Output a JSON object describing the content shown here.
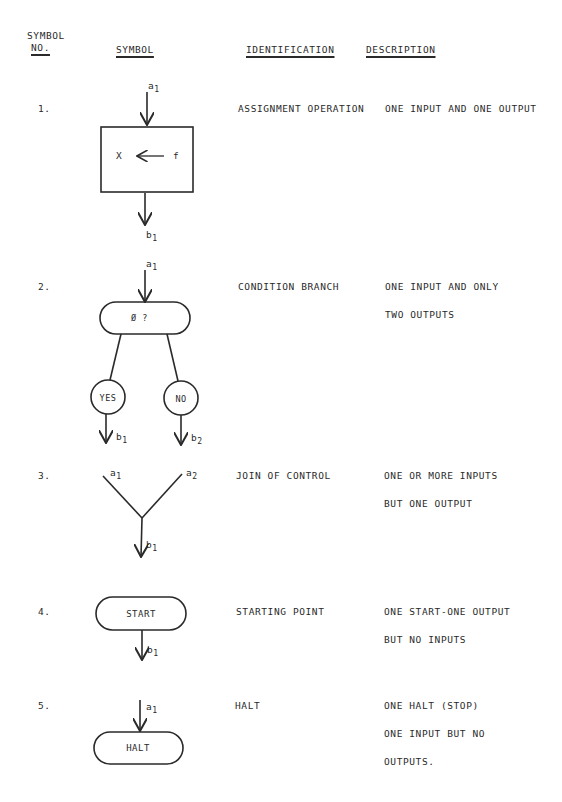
{
  "header": {
    "symbol_no_line1": "SYMBOL",
    "symbol_no_line2": "NO.",
    "symbol": "SYMBOL",
    "identification": "IDENTIFICATION",
    "description": "DESCRIPTION"
  },
  "rows": [
    {
      "number": "1.",
      "identification": "ASSIGNMENT OPERATION",
      "description": [
        "ONE INPUT AND ONE OUTPUT"
      ],
      "symbol": {
        "type": "rectangle",
        "content_left": "X",
        "content_right": "f",
        "arrow": "left-arrow",
        "input_label": "a",
        "input_sub": "1",
        "output_label": "b",
        "output_sub": "1"
      }
    },
    {
      "number": "2.",
      "identification": "CONDITION BRANCH",
      "description": [
        "ONE INPUT AND ONLY",
        "TWO OUTPUTS"
      ],
      "symbol": {
        "type": "pill",
        "content": "Ø ?",
        "input_label": "a",
        "input_sub": "1",
        "yes_label": "YES",
        "no_label": "NO",
        "output1_label": "b",
        "output1_sub": "1",
        "output2_label": "b",
        "output2_sub": "2"
      }
    },
    {
      "number": "3.",
      "identification": "JOIN OF CONTROL",
      "description": [
        "ONE OR MORE INPUTS",
        "BUT ONE OUTPUT"
      ],
      "symbol": {
        "type": "join",
        "input1_label": "a",
        "input1_sub": "1",
        "input2_label": "a",
        "input2_sub": "2",
        "output_label": "b",
        "output_sub": "1"
      }
    },
    {
      "number": "4.",
      "identification": "STARTING POINT",
      "description": [
        "ONE START-ONE OUTPUT",
        "BUT NO INPUTS"
      ],
      "symbol": {
        "type": "pill",
        "content": "START",
        "output_label": "b",
        "output_sub": "1"
      }
    },
    {
      "number": "5.",
      "identification": "HALT",
      "description": [
        "ONE HALT (STOP)",
        "ONE INPUT BUT NO",
        "OUTPUTS."
      ],
      "symbol": {
        "type": "pill",
        "content": "HALT",
        "input_label": "a",
        "input_sub": "1"
      }
    }
  ],
  "colors": {
    "ink": "#2a2a2a",
    "paper": "#ffffff"
  }
}
